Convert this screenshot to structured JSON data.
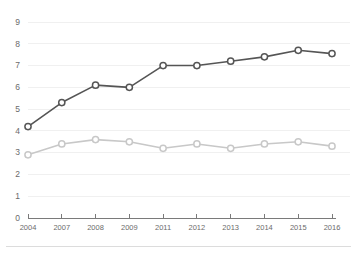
{
  "chart_data": {
    "type": "line",
    "title": "",
    "subtitle": "",
    "xlabel": "",
    "ylabel": "",
    "categories": [
      "2004",
      "2007",
      "2008",
      "2009",
      "2011",
      "2012",
      "2013",
      "2014",
      "2015",
      "2016"
    ],
    "series": [
      {
        "name": "dark-series",
        "color": "#555555",
        "marker": "open-circle",
        "values": [
          4.2,
          5.3,
          6.1,
          6.0,
          7.0,
          7.0,
          7.2,
          7.4,
          7.7,
          7.55
        ]
      },
      {
        "name": "light-series",
        "color": "#c8c8c8",
        "marker": "open-circle",
        "values": [
          2.9,
          3.4,
          3.6,
          3.5,
          3.2,
          3.4,
          3.2,
          3.4,
          3.5,
          3.3
        ]
      }
    ],
    "ylim": [
      0,
      9
    ],
    "yticks": [
      "0",
      "1",
      "2",
      "3",
      "4",
      "5",
      "6",
      "7",
      "8",
      "9"
    ],
    "grid": true,
    "grid_axis": "y",
    "legend": false,
    "legend_position": "none",
    "annotations": [],
    "colors": {
      "dark_series": "#555555",
      "light_series": "#c8c8c8",
      "gridline": "#f0f0f0",
      "axis": "#7a7a7a",
      "tick_label": "#6b6b6b",
      "background": "#ffffff"
    }
  }
}
